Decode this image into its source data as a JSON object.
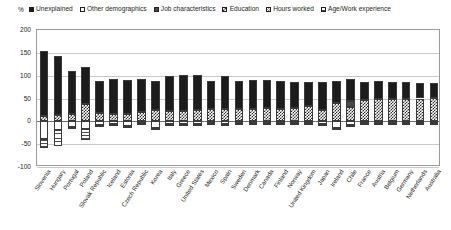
{
  "axis": {
    "unit_label": "%",
    "y_ticks": [
      200,
      150,
      100,
      50,
      0,
      -50,
      -100
    ],
    "ylim": [
      -100,
      200
    ],
    "ystep": 50
  },
  "legend": {
    "items": [
      {
        "label": "Unexplained",
        "swatch": "solid-black"
      },
      {
        "label": "Other demographics",
        "swatch": "solid-white"
      },
      {
        "label": "Job characteristics",
        "swatch": "solid-darkgrey"
      },
      {
        "label": "Education",
        "swatch": "checker-dark"
      },
      {
        "label": "Hours worked",
        "swatch": "checker-light"
      },
      {
        "label": "Age/Work experience",
        "swatch": "horizontal-lines"
      }
    ]
  },
  "chart_data": {
    "type": "bar",
    "subtype": "stacked",
    "title": "",
    "xlabel": "",
    "ylabel": "%",
    "ylim": [
      -100,
      200
    ],
    "grid": true,
    "legend_position": "top",
    "categories": [
      "Slovenia",
      "Hungary",
      "Portugal",
      "Poland",
      "Slovak Republic",
      "Iceland",
      "Estonia",
      "Czech Republic",
      "Korea",
      "Italy",
      "Greece",
      "United States",
      "Mexico",
      "Spain",
      "Sweden",
      "Denmark",
      "Canada",
      "Finland",
      "Norway",
      "United Kingdom",
      "Japan",
      "Ireland",
      "Chile",
      "France",
      "Austria",
      "Belgium",
      "Germany",
      "Netherlands",
      "Australia"
    ],
    "series": [
      {
        "name": "Unexplained",
        "values": [
          142,
          128,
          95,
          80,
          70,
          76,
          74,
          73,
          65,
          78,
          80,
          78,
          62,
          74,
          62,
          64,
          60,
          60,
          56,
          52,
          62,
          48,
          48,
          40,
          40,
          38,
          38,
          34,
          32
        ]
      },
      {
        "name": "Job characteristics",
        "values": [
          0,
          0,
          0,
          0,
          0,
          0,
          0,
          0,
          0,
          0,
          0,
          0,
          0,
          0,
          0,
          0,
          0,
          0,
          0,
          0,
          0,
          0,
          12,
          0,
          0,
          0,
          0,
          0,
          0
        ]
      },
      {
        "name": "Education",
        "values": [
          12,
          14,
          16,
          38,
          18,
          16,
          16,
          20,
          24,
          22,
          22,
          24,
          26,
          26,
          26,
          26,
          30,
          28,
          30,
          34,
          24,
          40,
          32,
          46,
          48,
          48,
          48,
          50,
          52
        ]
      },
      {
        "name": "Hours worked",
        "values": [
          0,
          0,
          0,
          0,
          0,
          0,
          0,
          0,
          0,
          0,
          0,
          0,
          0,
          0,
          0,
          0,
          0,
          0,
          0,
          0,
          0,
          0,
          0,
          0,
          0,
          0,
          0,
          0,
          0
        ]
      },
      {
        "name": "Other demographics",
        "values": [
          -38,
          -18,
          -12,
          -16,
          -8,
          -6,
          -10,
          -4,
          -14,
          -6,
          -5,
          -5,
          -4,
          -6,
          -4,
          -4,
          -4,
          -4,
          -4,
          -4,
          -6,
          -14,
          -8,
          -4,
          -4,
          -4,
          -4,
          -4,
          -4
        ]
      },
      {
        "name": "Age/Work experience",
        "values": [
          -20,
          -36,
          -4,
          -26,
          -4,
          -3,
          -3,
          -3,
          -4,
          -3,
          -3,
          -3,
          -3,
          -3,
          -3,
          -3,
          -3,
          -3,
          -3,
          -3,
          -3,
          -3,
          -3,
          -3,
          -3,
          -3,
          -3,
          -3,
          -3
        ]
      }
    ],
    "totals": [
      154,
      142,
      111,
      118,
      88,
      92,
      90,
      93,
      89,
      100,
      102,
      102,
      88,
      100,
      88,
      90,
      90,
      88,
      86,
      86,
      86,
      88,
      92,
      86,
      88,
      86,
      86,
      84,
      84
    ]
  }
}
